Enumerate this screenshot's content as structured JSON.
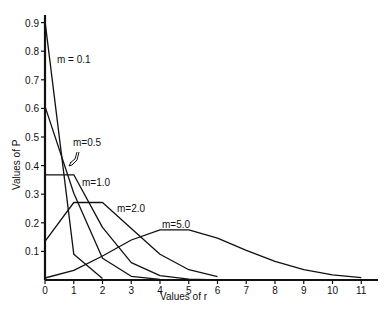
{
  "chart_data": {
    "type": "line",
    "title": "",
    "xlabel": "Values of r",
    "ylabel": "Values of P",
    "xlim": [
      0,
      11
    ],
    "ylim": [
      0,
      0.9
    ],
    "grid": false,
    "x_ticks": [
      "0",
      "1",
      "2",
      "3",
      "4",
      "5",
      "6",
      "7",
      "8",
      "9",
      "10",
      "11"
    ],
    "y_ticks": [
      "0.1",
      "0.2",
      "0.3",
      "0.4",
      "0.5",
      "0.6",
      "0.7",
      "0.8",
      "0.9"
    ],
    "series": [
      {
        "name": "m=0.1",
        "x": [
          0,
          1,
          2
        ],
        "values": [
          0.905,
          0.09,
          0.005
        ]
      },
      {
        "name": "m=0.5",
        "x": [
          0,
          1,
          2,
          3,
          4
        ],
        "values": [
          0.607,
          0.303,
          0.076,
          0.013,
          0.002
        ]
      },
      {
        "name": "m=1.0",
        "x": [
          0,
          1,
          2,
          3,
          4,
          5,
          6
        ],
        "values": [
          0.368,
          0.368,
          0.184,
          0.061,
          0.015,
          0.003,
          0.0005
        ]
      },
      {
        "name": "m=2.0",
        "x": [
          0,
          1,
          2,
          3,
          4,
          5,
          6
        ],
        "values": [
          0.135,
          0.271,
          0.271,
          0.18,
          0.09,
          0.036,
          0.012
        ]
      },
      {
        "name": "m=5.0",
        "x": [
          0,
          1,
          2,
          3,
          4,
          5,
          6,
          7,
          8,
          9,
          10,
          11
        ],
        "values": [
          0.007,
          0.034,
          0.084,
          0.14,
          0.175,
          0.175,
          0.146,
          0.104,
          0.065,
          0.036,
          0.018,
          0.008
        ]
      }
    ],
    "annotations": [
      {
        "text": "m=0.1",
        "series": "m=0.1"
      },
      {
        "text": "m=0.5",
        "series": "m=0.5",
        "arrow": true
      },
      {
        "text": "m=1.0",
        "series": "m=1.0"
      },
      {
        "text": "m=2.0",
        "series": "m=2.0"
      },
      {
        "text": "m=5.0",
        "series": "m=5.0"
      }
    ]
  },
  "labels": {
    "xlabel": "Values of r",
    "ylabel": "Values of P",
    "m01": "m = 0.1",
    "m05": "m=0.5",
    "m10": "m=1.0",
    "m20": "m=2.0",
    "m50": "m=5.0"
  }
}
